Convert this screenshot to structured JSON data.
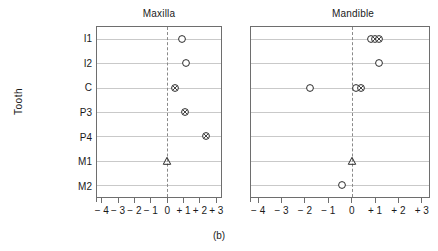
{
  "caption": "(b)",
  "axis_title_y": "Tooth",
  "panels": [
    {
      "key": "maxilla",
      "title": "Maxilla"
    },
    {
      "key": "mandible",
      "title": "Mandible"
    }
  ],
  "tick_labels": [
    "− 4",
    "− 3",
    "− 2",
    "− 1",
    "0",
    "+ 1",
    "+ 2",
    "+ 3"
  ],
  "tick_values": [
    -4,
    -3,
    -2,
    -1,
    0,
    1,
    2,
    3
  ],
  "category_labels": [
    "I1",
    "I2",
    "C",
    "P3",
    "P4",
    "M1",
    "M2"
  ],
  "colors": {
    "frame": "#6e6e6e",
    "grid": "#c9c9c9",
    "zero_line": "#8a8a8a",
    "marker": "#2b2b2b",
    "text": "#1a1a1a",
    "background": "#ffffff"
  },
  "chart_data": {
    "type": "scatter",
    "title": "",
    "xlabel": "",
    "ylabel": "Tooth",
    "xlim": [
      -4.35,
      3.35
    ],
    "xticks": [
      -4,
      -3,
      -2,
      -1,
      0,
      1,
      2,
      3
    ],
    "categories": [
      "I1",
      "I2",
      "C",
      "P3",
      "P4",
      "M1",
      "M2"
    ],
    "grid": true,
    "legend_position": "none",
    "reference_line_x": 0,
    "marker_types": [
      "open-circle",
      "circled-x",
      "open-triangle"
    ],
    "panels": [
      {
        "name": "Maxilla",
        "points": [
          {
            "tooth": "I1",
            "x": 0.95,
            "marker": "open-circle"
          },
          {
            "tooth": "I2",
            "x": 1.15,
            "marker": "open-circle"
          },
          {
            "tooth": "C",
            "x": 0.5,
            "marker": "circled-x"
          },
          {
            "tooth": "P3",
            "x": 1.1,
            "marker": "circled-x"
          },
          {
            "tooth": "P4",
            "x": 2.4,
            "marker": "circled-x"
          },
          {
            "tooth": "M1",
            "x": 0.0,
            "marker": "open-triangle"
          }
        ]
      },
      {
        "name": "Mandible",
        "points": [
          {
            "tooth": "I1",
            "x": 0.82,
            "marker": "open-circle"
          },
          {
            "tooth": "I1",
            "x": 1.0,
            "marker": "circled-x"
          },
          {
            "tooth": "I1",
            "x": 1.18,
            "marker": "circled-x"
          },
          {
            "tooth": "I2",
            "x": 1.2,
            "marker": "open-circle"
          },
          {
            "tooth": "C",
            "x": -1.8,
            "marker": "open-circle"
          },
          {
            "tooth": "C",
            "x": 0.2,
            "marker": "open-circle"
          },
          {
            "tooth": "C",
            "x": 0.42,
            "marker": "circled-x"
          },
          {
            "tooth": "M1",
            "x": 0.0,
            "marker": "open-triangle"
          },
          {
            "tooth": "M2",
            "x": -0.42,
            "marker": "open-circle"
          }
        ]
      }
    ]
  }
}
